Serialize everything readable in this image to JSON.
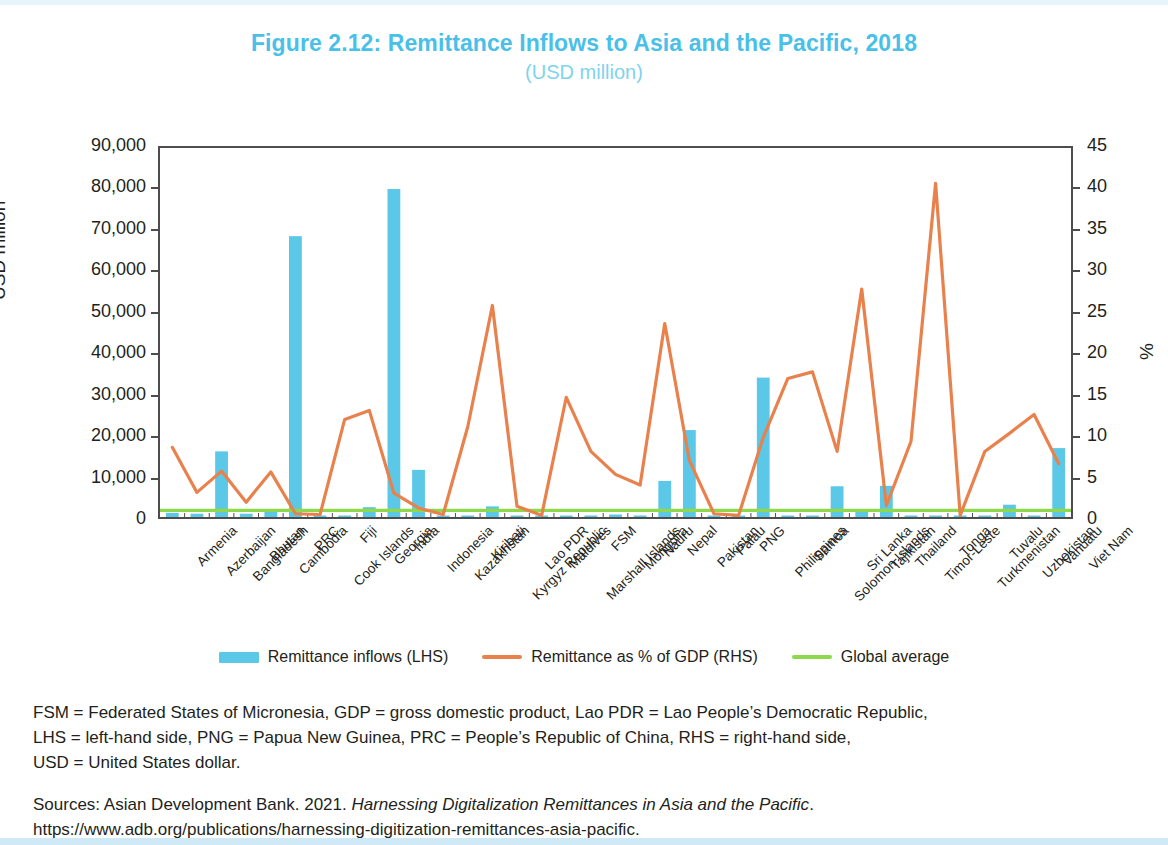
{
  "figure": {
    "title": "Figure 2.12: Remittance Inflows to Asia and the Pacific, 2018",
    "subtitle": "(USD million)",
    "title_color": "#49c0e8"
  },
  "axes": {
    "left_title": "USD million",
    "right_title": "%",
    "left_ticks": [
      "0",
      "10,000",
      "20,000",
      "30,000",
      "40,000",
      "50,000",
      "60,000",
      "70,000",
      "80,000",
      "90,000"
    ],
    "right_ticks": [
      "0",
      "5",
      "10",
      "15",
      "20",
      "25",
      "30",
      "35",
      "40",
      "45"
    ]
  },
  "legend": {
    "items": [
      {
        "label": "Remittance inflows (LHS)",
        "color": "#5bc8e8",
        "type": "bar"
      },
      {
        "label": "Remittance as % of GDP (RHS)",
        "color": "#e8814c",
        "type": "line"
      },
      {
        "label": "Global average",
        "color": "#8fd84c",
        "type": "line"
      }
    ]
  },
  "notes": {
    "abbreviations_line1": "FSM = Federated States of Micronesia, GDP = gross domestic product, Lao PDR = Lao People’s Democratic Republic,",
    "abbreviations_line2": "LHS = left-hand side, PNG = Papua New Guinea, PRC = People’s Republic of China, RHS = right-hand side,",
    "abbreviations_line3": "USD = United States dollar.",
    "sources_prefix": "Sources: Asian Development Bank. 2021. ",
    "sources_italic": "Harnessing Digitalization Remittances in Asia and the Pacific",
    "sources_suffix": ". https://www.adb.org/publications/harnessing-digitization-remittances-asia-pacific."
  },
  "chart_data": {
    "type": "bar",
    "title": "Figure 2.12: Remittance Inflows to Asia and the Pacific, 2018",
    "subtitle": "(USD million)",
    "xlabel": "",
    "ylabel": "USD million",
    "y2label": "%",
    "ylim": [
      0,
      90000
    ],
    "y2lim": [
      0,
      45
    ],
    "grid": false,
    "legend_position": "bottom",
    "categories": [
      "Armenia",
      "Azerbaijan",
      "Bangladesh",
      "Bhutan",
      "Cambodia",
      "PRC",
      "Cook Islands",
      "Fiji",
      "Georgia",
      "India",
      "Indonesia",
      "Kazakhstan",
      "Kiribati",
      "Kyrgyz Republic",
      "Lao PDR",
      "Maldives",
      "Marshall Islands",
      "FSM",
      "Mongolia",
      "Nauru",
      "Nepal",
      "Pakistan",
      "Palau",
      "PNG",
      "Philippines",
      "Samoa",
      "Solomon Islands",
      "Sri Lanka",
      "Tajikistan",
      "Thailand",
      "Timor-Leste",
      "Tonga",
      "Turkmenistan",
      "Tuvalu",
      "Uzbekistan",
      "Vanuatu",
      "Viet Nam"
    ],
    "series": [
      {
        "name": "Remittance inflows (LHS)",
        "type": "bar",
        "axis": "left",
        "unit": "USD million",
        "color": "#5bc8e8",
        "values": [
          1000,
          800,
          16000,
          800,
          1500,
          68500,
          200,
          300,
          2400,
          80000,
          11500,
          300,
          200,
          2600,
          300,
          200,
          60,
          50,
          600,
          30,
          8800,
          21200,
          100,
          100,
          34000,
          300,
          50,
          7500,
          1900,
          7600,
          120,
          200,
          50,
          20,
          3000,
          50,
          16800
        ]
      },
      {
        "name": "Remittance as % of GDP (RHS)",
        "type": "line",
        "axis": "right",
        "unit": "%",
        "color": "#e8814c",
        "values": [
          8.5,
          3.0,
          5.6,
          1.8,
          5.5,
          0.4,
          0.3,
          11.9,
          13.0,
          2.9,
          1.1,
          0.3,
          11.0,
          25.8,
          1.3,
          0.2,
          14.6,
          8.0,
          5.2,
          3.9,
          23.6,
          6.9,
          0.4,
          0.2,
          9.7,
          16.9,
          17.7,
          8.0,
          27.8,
          1.4,
          9.2,
          40.7,
          0.2,
          8.0,
          10.2,
          12.5,
          6.5
        ]
      },
      {
        "name": "Global average",
        "type": "line",
        "axis": "right",
        "unit": "%",
        "color": "#8fd84c",
        "constant": 0.8,
        "values": [
          0.8,
          0.8,
          0.8,
          0.8,
          0.8,
          0.8,
          0.8,
          0.8,
          0.8,
          0.8,
          0.8,
          0.8,
          0.8,
          0.8,
          0.8,
          0.8,
          0.8,
          0.8,
          0.8,
          0.8,
          0.8,
          0.8,
          0.8,
          0.8,
          0.8,
          0.8,
          0.8,
          0.8,
          0.8,
          0.8,
          0.8,
          0.8,
          0.8,
          0.8,
          0.8,
          0.8,
          0.8
        ]
      }
    ]
  }
}
